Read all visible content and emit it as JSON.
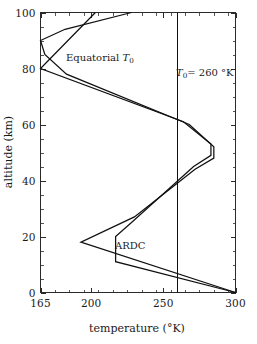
{
  "figure": {
    "background_color": "#ffffff",
    "line_color": "#101010",
    "axis_color": "#2a2a2a"
  },
  "axes": {
    "x_title": "temperature (°K)",
    "y_title": "altitude (km)",
    "x_ticks": [
      "165",
      "200",
      "250",
      "300"
    ],
    "y_ticks": [
      "0",
      "20",
      "40",
      "60",
      "80",
      "100"
    ]
  },
  "annotations": {
    "equatorial": {
      "text": "Equatorial T0",
      "base": "Equatorial ",
      "symbol": "T",
      "subscript": "0"
    },
    "reference": {
      "text": "T0 = 260 °K",
      "symbol": "T",
      "subscript": "0",
      "rest": "= 260 °K"
    },
    "ardc": {
      "text": "ARDC"
    }
  },
  "chart_data": {
    "type": "line",
    "title": "",
    "subtitle": "",
    "xlabel": "temperature (°K)",
    "ylabel": "altitude (km)",
    "xlim": [
      165,
      300
    ],
    "ylim": [
      0,
      100
    ],
    "xticks": [
      165,
      200,
      250,
      300
    ],
    "yticks": [
      0,
      20,
      40,
      60,
      80,
      100
    ],
    "x_minor_tick_step": 10,
    "y_minor_tick_step": 5,
    "grid": false,
    "legend": "none (curves labelled inline)",
    "orientation": "temperature on x-axis, altitude on y-axis",
    "annotations": [
      {
        "label": "Equatorial T0",
        "x_data": 193,
        "y_data": 83
      },
      {
        "label": "T0 = 260 °K",
        "x_data": 262,
        "y_data": 78
      },
      {
        "label": "ARDC",
        "x_data": 222,
        "y_data": 19
      }
    ],
    "series": [
      {
        "name": "ARDC",
        "comment": "ARDC standard atmosphere temperature profile; points are (temperature K, altitude km)",
        "points": [
          [
            300,
            0
          ],
          [
            217,
            11
          ],
          [
            217,
            20
          ],
          [
            228,
            25
          ],
          [
            271,
            45
          ],
          [
            283,
            49
          ],
          [
            283,
            53
          ],
          [
            264,
            61
          ],
          [
            165,
            80
          ],
          [
            203,
            100
          ]
        ]
      },
      {
        "name": "Equatorial T0",
        "comment": "Equatorial temperature profile; points are (temperature K, altitude km)",
        "points": [
          [
            300,
            0
          ],
          [
            193,
            18
          ],
          [
            230,
            27
          ],
          [
            272,
            44
          ],
          [
            285,
            48
          ],
          [
            285,
            52
          ],
          [
            268,
            60
          ],
          [
            183,
            78
          ],
          [
            168,
            85
          ],
          [
            165,
            90
          ],
          [
            182,
            94
          ],
          [
            228,
            100
          ]
        ]
      },
      {
        "name": "T0 = 260 °K",
        "comment": "Vertical isothermal reference line at 260 K spanning full altitude range",
        "points": [
          [
            260,
            0
          ],
          [
            260,
            100
          ]
        ]
      }
    ]
  }
}
